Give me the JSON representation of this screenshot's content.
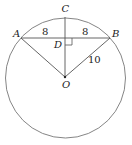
{
  "diagram": {
    "type": "circle-geometry",
    "circle": {
      "center_label": "O",
      "cx": 65,
      "cy": 77,
      "r": 60
    },
    "points": [
      {
        "label": "A",
        "x": 21,
        "y": 38
      },
      {
        "label": "B",
        "x": 110,
        "y": 38
      },
      {
        "label": "C",
        "x": 65,
        "y": 17
      },
      {
        "label": "D",
        "x": 65,
        "y": 38
      },
      {
        "label": "O",
        "x": 65,
        "y": 77
      }
    ],
    "labels": {
      "A": "A",
      "B": "B",
      "C": "C",
      "D": "D",
      "O": "O"
    },
    "measurements": {
      "AD": "8",
      "DB": "8",
      "OB": "10"
    },
    "segments": [
      "AB",
      "CO",
      "AO",
      "BO"
    ],
    "right_angle_at": "D",
    "stroke_color": "#555555"
  }
}
